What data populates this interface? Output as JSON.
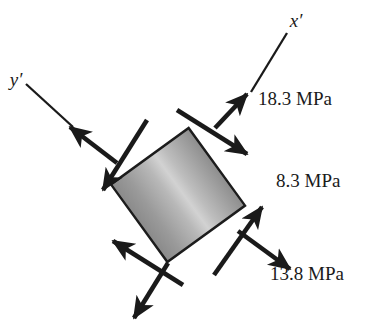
{
  "figure": {
    "type": "stress-element-diagram",
    "title": "",
    "background_color": "#ffffff",
    "ink_color": "#1a1a1a"
  },
  "element": {
    "shape": "square",
    "rotation_deg": -36,
    "center": {
      "x": 178,
      "y": 195
    },
    "side_px": 96,
    "fill_dark": "#8b8b8b",
    "fill_light": "#cfcfcf",
    "border_color": "#1c1c1c"
  },
  "axes": [
    {
      "name": "x-prime-axis",
      "label": "x′",
      "label_x": 296,
      "label_y": 27
    },
    {
      "name": "y-prime-axis",
      "label": "y′",
      "label_x": 16,
      "label_y": 86
    }
  ],
  "stresses": [
    {
      "name": "normal-stress-x-prime",
      "label": "18.3 MPa",
      "value": 18.3,
      "unit": "MPa",
      "sense": "tension",
      "face": "top-right",
      "label_x": 258,
      "label_y": 105
    },
    {
      "name": "shear-stress",
      "label": "8.3 MPa",
      "value": 8.3,
      "unit": "MPa",
      "sense": "shear",
      "face": "right",
      "label_x": 276,
      "label_y": 187
    },
    {
      "name": "normal-stress-y-prime",
      "label": "13.8 MPa",
      "value": 13.8,
      "unit": "MPa",
      "sense": "tension",
      "face": "bottom-right",
      "label_x": 270,
      "label_y": 280
    }
  ]
}
